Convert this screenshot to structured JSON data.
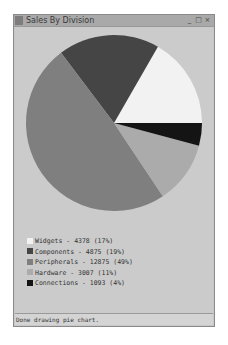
{
  "window": {
    "title": "Sales By Division",
    "buttons": {
      "minimize": "_",
      "maximize": "□",
      "close": "×"
    }
  },
  "chart_data": {
    "type": "pie",
    "title": "Sales By Division",
    "categories": [
      "Widgets",
      "Components",
      "Peripherals",
      "Hardware",
      "Connections"
    ],
    "values": [
      4378,
      4875,
      12875,
      3007,
      1093
    ],
    "percentages": [
      17,
      19,
      49,
      11,
      4
    ],
    "colors": [
      "#f2f2f2",
      "#454545",
      "#7f7f7f",
      "#ababab",
      "#141414"
    ],
    "start_angle_deg": 0,
    "direction": "counterclockwise",
    "legend_position": "bottom-left"
  },
  "legend": [
    {
      "label": "Widgets - 4378 (17%)",
      "color": "#f2f2f2"
    },
    {
      "label": "Components - 4875 (19%)",
      "color": "#454545"
    },
    {
      "label": "Peripherals - 12875 (49%)",
      "color": "#7f7f7f"
    },
    {
      "label": "Hardware - 3007 (11%)",
      "color": "#ababab"
    },
    {
      "label": "Connections - 1093 (4%)",
      "color": "#141414"
    }
  ],
  "status": {
    "text": "Done drawing pie chart."
  }
}
